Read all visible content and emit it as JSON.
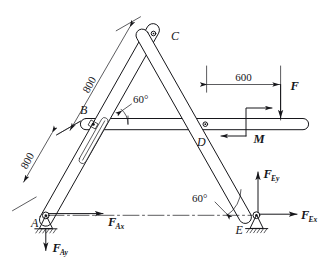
{
  "figure": {
    "background_color": "#ffffff",
    "line_color": "#16161a"
  },
  "joints": [
    {
      "id": "A",
      "label": "A",
      "type": "pin-support",
      "x": 45,
      "y": 215
    },
    {
      "id": "B",
      "label": "B",
      "type": "slotted-pin",
      "x": 93,
      "y": 123
    },
    {
      "id": "C",
      "label": "C",
      "type": "pin-joint",
      "x": 157,
      "y": 33
    },
    {
      "id": "D",
      "label": "D",
      "type": "pin-joint",
      "x": 205,
      "y": 124
    },
    {
      "id": "E",
      "label": "E",
      "type": "pin-support",
      "x": 256,
      "y": 215
    }
  ],
  "dimensions": [
    {
      "name": "dim-800-upper",
      "value": "800",
      "unit": "",
      "orientation": "along-left-bar-upper"
    },
    {
      "name": "dim-800-lower",
      "value": "800",
      "unit": "",
      "orientation": "along-left-bar-lower"
    },
    {
      "name": "dim-600",
      "value": "600",
      "unit": "",
      "orientation": "horizontal"
    }
  ],
  "angles": [
    {
      "name": "angle-at-B",
      "value": "60°",
      "vertex": "B"
    },
    {
      "name": "angle-at-E",
      "value": "60°",
      "vertex": "E"
    }
  ],
  "loads": [
    {
      "name": "force-F",
      "label": "F",
      "direction": "down",
      "type": "force"
    },
    {
      "name": "couple-M",
      "label": "M",
      "direction": "counter-clockwise",
      "type": "couple"
    }
  ],
  "reactions": [
    {
      "name": "reaction-FAx",
      "base": "F",
      "sub": "Ax",
      "direction": "right",
      "at": "A"
    },
    {
      "name": "reaction-FAy",
      "base": "F",
      "sub": "Ay",
      "direction": "down",
      "at": "A"
    },
    {
      "name": "reaction-FEx",
      "base": "F",
      "sub": "Ex",
      "direction": "right",
      "at": "E"
    },
    {
      "name": "reaction-FEy",
      "base": "F",
      "sub": "Ey",
      "direction": "up",
      "at": "E"
    }
  ],
  "labels": {
    "A": "A",
    "B": "B",
    "C": "C",
    "D": "D",
    "E": "E",
    "F": "F",
    "M": "M",
    "dim_800_a": "800",
    "dim_800_b": "800",
    "dim_600": "600",
    "angle_b": "60°",
    "angle_e": "60°",
    "F_base": "F",
    "Ax": "Ax",
    "Ay": "Ay",
    "Ex": "Ex",
    "Ey": "Ey"
  }
}
